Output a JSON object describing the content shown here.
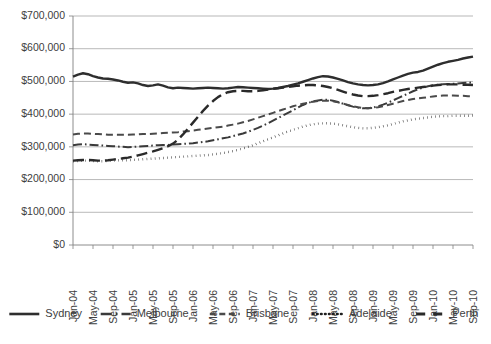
{
  "chart_data": {
    "type": "line",
    "title": "",
    "subtitle": "",
    "xlabel": "",
    "ylabel": "",
    "ylim": [
      0,
      700000
    ],
    "ytick_values": [
      0,
      100000,
      200000,
      300000,
      400000,
      500000,
      600000,
      700000
    ],
    "ytick_labels": [
      "$0",
      "$100,000",
      "$200,000",
      "$300,000",
      "$400,000",
      "$500,000",
      "$600,000",
      "$700,000"
    ],
    "grid": true,
    "grid_axis": "y",
    "legend_position": "bottom",
    "x_tick_labels": [
      "Jan-04",
      "May-04",
      "Sep-04",
      "Jan-05",
      "May-05",
      "Sep-05",
      "Jan-06",
      "May-06",
      "Sep-06",
      "Jan-07",
      "May-07",
      "Sep-07",
      "Jan-08",
      "May-08",
      "Sep-08",
      "Jan-09",
      "May-09",
      "Sep-09",
      "Jan-10",
      "May-10",
      "Sep-10"
    ],
    "x_tick_rotation_deg": 90,
    "x_points_count": 81,
    "x_label_every": 4,
    "series": [
      {
        "name": "Sydney",
        "style": "solid",
        "color": "#2e2e2e",
        "width": 2.4,
        "dasharray": "",
        "values": [
          515000,
          521000,
          525000,
          522000,
          516000,
          512000,
          509000,
          508000,
          506000,
          503000,
          499000,
          496000,
          497000,
          494000,
          489000,
          486000,
          488000,
          491000,
          487000,
          482000,
          479000,
          481000,
          480000,
          479000,
          478000,
          479000,
          480000,
          481000,
          480000,
          479000,
          478000,
          479000,
          481000,
          483000,
          482000,
          481000,
          480000,
          479000,
          478000,
          477000,
          478000,
          480000,
          483000,
          486000,
          490000,
          494000,
          499000,
          504000,
          509000,
          513000,
          516000,
          515000,
          512000,
          508000,
          503000,
          498000,
          494000,
          491000,
          489000,
          488000,
          489000,
          491000,
          495000,
          500000,
          506000,
          512000,
          518000,
          523000,
          527000,
          529000,
          533000,
          539000,
          545000,
          551000,
          556000,
          560000,
          563000,
          566000,
          570000,
          573000,
          576000
        ]
      },
      {
        "name": "Melbourne",
        "style": "dash-dot",
        "color": "#3a3a3a",
        "width": 2.0,
        "dasharray": "9,3,1.6,3",
        "values": [
          305000,
          307000,
          308000,
          307000,
          306000,
          305000,
          304000,
          303000,
          302000,
          301000,
          300000,
          299000,
          300000,
          301000,
          302000,
          303000,
          304000,
          305000,
          306000,
          306000,
          307000,
          308000,
          309000,
          310000,
          311000,
          313000,
          315000,
          317000,
          320000,
          323000,
          326000,
          329000,
          333000,
          337000,
          341000,
          346000,
          352000,
          358000,
          365000,
          372000,
          380000,
          388000,
          396000,
          404000,
          412000,
          420000,
          428000,
          434000,
          439000,
          442000,
          444000,
          444000,
          441000,
          437000,
          432000,
          427000,
          423000,
          420000,
          418000,
          418000,
          420000,
          424000,
          429000,
          435000,
          442000,
          449000,
          456000,
          463000,
          470000,
          476000,
          481000,
          485000,
          488000,
          490000,
          491000,
          492000,
          493000,
          494000,
          495000,
          496000,
          497000
        ]
      },
      {
        "name": "Brisbane",
        "style": "dashed",
        "color": "#4a4a4a",
        "width": 2.0,
        "dasharray": "7,4",
        "values": [
          338000,
          340000,
          341000,
          341000,
          340000,
          339000,
          338000,
          337000,
          337000,
          337000,
          337000,
          337000,
          338000,
          338000,
          339000,
          339000,
          340000,
          341000,
          342000,
          343000,
          344000,
          345000,
          347000,
          348000,
          350000,
          352000,
          354000,
          356000,
          358000,
          360000,
          362000,
          365000,
          368000,
          371000,
          375000,
          379000,
          384000,
          389000,
          394000,
          399000,
          404000,
          409000,
          414000,
          419000,
          424000,
          428000,
          432000,
          435000,
          438000,
          440000,
          441000,
          441000,
          439000,
          436000,
          432000,
          428000,
          424000,
          421000,
          419000,
          418000,
          419000,
          421000,
          424000,
          428000,
          432000,
          436000,
          440000,
          443000,
          446000,
          448000,
          450000,
          452000,
          454000,
          456000,
          457000,
          457000,
          457000,
          456000,
          456000,
          455000,
          455000
        ]
      },
      {
        "name": "Adelaide",
        "style": "dotted",
        "color": "#1f1f1f",
        "width": 2.4,
        "dasharray": "0.5,3.6",
        "values": [
          256000,
          257000,
          258000,
          258000,
          257000,
          256000,
          256000,
          257000,
          258000,
          259000,
          259000,
          259000,
          260000,
          261000,
          262000,
          263000,
          264000,
          265000,
          266000,
          267000,
          268000,
          269000,
          270000,
          271000,
          272000,
          273000,
          274000,
          275000,
          277000,
          279000,
          281000,
          284000,
          287000,
          291000,
          295000,
          300000,
          305000,
          311000,
          317000,
          323000,
          329000,
          335000,
          341000,
          347000,
          352000,
          357000,
          362000,
          366000,
          369000,
          371000,
          372000,
          372000,
          371000,
          369000,
          366000,
          363000,
          360000,
          358000,
          357000,
          357000,
          358000,
          360000,
          363000,
          366000,
          370000,
          374000,
          378000,
          381000,
          384000,
          386000,
          388000,
          390000,
          392000,
          393000,
          394000,
          394000,
          395000,
          395000,
          395000,
          395000,
          396000
        ]
      },
      {
        "name": "Perth",
        "style": "long-dash",
        "color": "#2a2a2a",
        "width": 2.4,
        "dasharray": "11,5",
        "values": [
          258000,
          259000,
          260000,
          260000,
          259000,
          258000,
          258000,
          259000,
          261000,
          263000,
          265000,
          267000,
          270000,
          274000,
          278000,
          282000,
          286000,
          291000,
          296000,
          302000,
          310000,
          322000,
          338000,
          356000,
          374000,
          392000,
          410000,
          426000,
          440000,
          452000,
          461000,
          467000,
          470000,
          471000,
          471000,
          470000,
          470000,
          471000,
          473000,
          475000,
          477000,
          479000,
          481000,
          483000,
          485000,
          487000,
          488000,
          489000,
          489000,
          488000,
          486000,
          483000,
          479000,
          474000,
          469000,
          464000,
          460000,
          457000,
          455000,
          455000,
          456000,
          458000,
          461000,
          464000,
          468000,
          471000,
          474000,
          477000,
          479000,
          481000,
          483000,
          485000,
          487000,
          489000,
          490000,
          491000,
          491000,
          491000,
          490000,
          490000,
          489000
        ]
      }
    ],
    "legend_entries": [
      {
        "label": "Sydney",
        "style": "solid",
        "dasharray": "",
        "width": 2.6,
        "color": "#2e2e2e"
      },
      {
        "label": "Melbourne",
        "style": "dash-dot",
        "dasharray": "11,4,1.8,4",
        "width": 2.4,
        "color": "#3a3a3a"
      },
      {
        "label": "Brisbane",
        "style": "dashed",
        "dasharray": "6,3.5",
        "width": 2.4,
        "color": "#4a4a4a"
      },
      {
        "label": "Adelaide",
        "style": "dotted",
        "dasharray": "0.6,3.4",
        "width": 2.6,
        "color": "#1f1f1f"
      },
      {
        "label": "Perth",
        "style": "long-dash",
        "dasharray": "9,8",
        "width": 3.0,
        "color": "#2a2a2a"
      }
    ]
  },
  "plot_geometry": {
    "left": 73,
    "right": 473,
    "top": 16,
    "bottom": 245
  }
}
